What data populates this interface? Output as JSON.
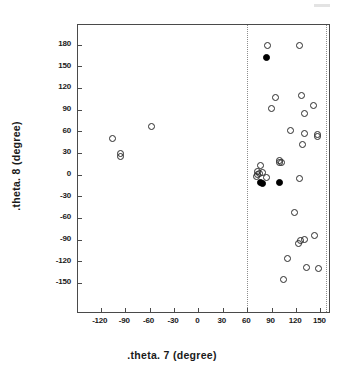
{
  "figure": {
    "artifact_label": "scan-speck"
  },
  "axes": {
    "x_title": ".theta. 7  (degree)",
    "y_title": ".theta. 8  (degree)",
    "x_ticks": [
      "-120",
      "-90",
      "-60",
      "-30",
      "0",
      "30",
      "60",
      "90",
      "120",
      "150"
    ],
    "y_ticks": [
      "180",
      "150",
      "120",
      "90",
      "60",
      "30",
      "0",
      "-30",
      "-60",
      "-90",
      "-120",
      "-150"
    ]
  },
  "chart_data": {
    "type": "scatter",
    "title": "",
    "xlabel": ".theta. 7  (degree)",
    "ylabel": ".theta. 8  (degree)",
    "xlim": [
      -148,
      163
    ],
    "ylim": [
      -193,
      207
    ],
    "xticks": [
      -120,
      -90,
      -60,
      -30,
      0,
      30,
      60,
      90,
      120,
      150
    ],
    "yticks": [
      180,
      150,
      120,
      90,
      60,
      30,
      0,
      -30,
      -60,
      -90,
      -120,
      -150
    ],
    "grid": false,
    "legend": null,
    "annotations": {
      "vertical_reference_lines": [
        60,
        157
      ]
    },
    "series": [
      {
        "name": "open-circles",
        "marker": "open circle",
        "color": "#2b2b2b",
        "points": [
          [
            -105,
            50
          ],
          [
            -96,
            29
          ],
          [
            -96,
            25
          ],
          [
            -58,
            66
          ],
          [
            85,
            179
          ],
          [
            124,
            178
          ],
          [
            95,
            107
          ],
          [
            90,
            91
          ],
          [
            127,
            110
          ],
          [
            142,
            96
          ],
          [
            131,
            84
          ],
          [
            113,
            61
          ],
          [
            130,
            57
          ],
          [
            146,
            55
          ],
          [
            146,
            52
          ],
          [
            128,
            41
          ],
          [
            100,
            20
          ],
          [
            100,
            17
          ],
          [
            102,
            17
          ],
          [
            76,
            12
          ],
          [
            73,
            4
          ],
          [
            79,
            3
          ],
          [
            75,
            1
          ],
          [
            73,
            0
          ],
          [
            71,
            -2
          ],
          [
            84,
            -4
          ],
          [
            124,
            -6
          ],
          [
            118,
            -53
          ],
          [
            143,
            -85
          ],
          [
            125,
            -91
          ],
          [
            131,
            -90
          ],
          [
            123,
            -95
          ],
          [
            110,
            -116
          ],
          [
            133,
            -128
          ],
          [
            148,
            -130
          ],
          [
            105,
            -145
          ]
        ]
      },
      {
        "name": "filled-circles",
        "marker": "filled circle",
        "color": "#000000",
        "points": [
          [
            84,
            162
          ],
          [
            76,
            -11
          ],
          [
            79,
            -12
          ],
          [
            100,
            -11
          ]
        ]
      }
    ]
  }
}
